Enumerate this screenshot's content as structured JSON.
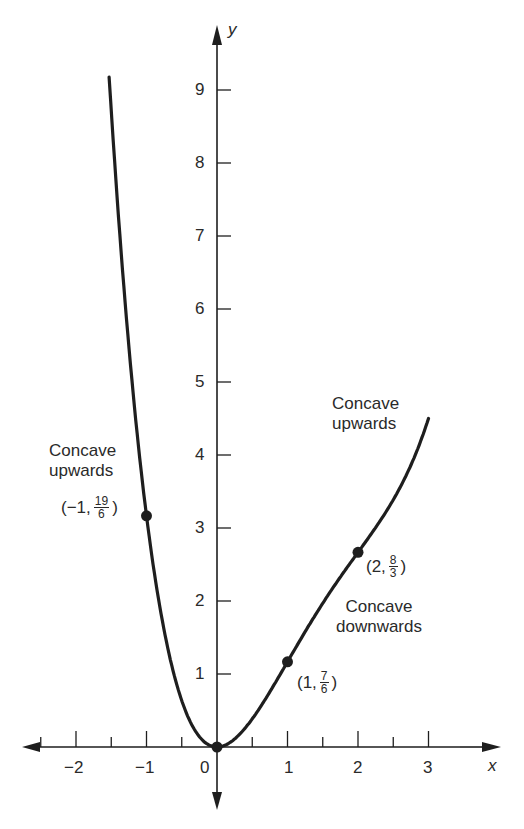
{
  "chart_data": {
    "type": "line",
    "title": "",
    "xlabel": "x",
    "ylabel": "y",
    "function": "y = x^4/6 - x^3 + 2x^2",
    "xlim": [
      -2.5,
      3.5
    ],
    "ylim": [
      -0.3,
      9.7
    ],
    "x_ticks": [
      -2,
      -1,
      0,
      1,
      2,
      3
    ],
    "x_minor_ticks": [
      -2.5,
      -1.5,
      -0.5,
      0.5,
      1.5,
      2.5
    ],
    "y_ticks": [
      1,
      2,
      3,
      4,
      5,
      6,
      7,
      8,
      9
    ],
    "grid": false,
    "series": [
      {
        "name": "curve",
        "x": [
          -1.53,
          -1.4,
          -1.2,
          -1.0,
          -0.8,
          -0.6,
          -0.4,
          -0.2,
          0,
          0.2,
          0.4,
          0.6,
          0.8,
          1.0,
          1.2,
          1.4,
          1.6,
          1.8,
          2.0,
          2.2,
          2.4,
          2.6,
          2.8,
          3.0
        ],
        "y": [
          9.28,
          7.36,
          5.07,
          3.17,
          1.86,
          0.96,
          0.39,
          0.09,
          0,
          0.07,
          0.26,
          0.51,
          0.79,
          1.17,
          1.49,
          1.83,
          2.14,
          2.43,
          2.67,
          2.87,
          3.05,
          3.22,
          3.4,
          4.5
        ]
      }
    ],
    "marked_points": [
      {
        "x": -1,
        "y": 3.1667,
        "label": "(−1, 19/6)"
      },
      {
        "x": 0,
        "y": 0,
        "label": ""
      },
      {
        "x": 1,
        "y": 1.1667,
        "label": "(1, 7/6)"
      },
      {
        "x": 2,
        "y": 2.6667,
        "label": "(2, 8/3)"
      }
    ],
    "annotations": [
      {
        "text": "Concave upwards",
        "near": "left branch"
      },
      {
        "text": "Concave upwards",
        "near": "right end"
      },
      {
        "text": "Concave downwards",
        "near": "between x=1 and x=2"
      }
    ]
  },
  "labels": {
    "x_axis": "x",
    "y_axis": "y",
    "x_ticks": [
      "−2",
      "−1",
      "0",
      "1",
      "2",
      "3"
    ],
    "y_ticks": [
      "1",
      "2",
      "3",
      "4",
      "5",
      "6",
      "7",
      "8",
      "9"
    ],
    "left_annotation_line1": "Concave",
    "left_annotation_line2": "upwards",
    "right_annotation_line1": "Concave",
    "right_annotation_line2": "upwards",
    "mid_annotation_line1": "Concave",
    "mid_annotation_line2": "downwards",
    "pt_neg1": {
      "prefix": "(−1,",
      "num": "19",
      "den": "6",
      "suffix": ")"
    },
    "pt_1": {
      "prefix": "(1,",
      "num": "7",
      "den": "6",
      "suffix": ")"
    },
    "pt_2": {
      "prefix": "(2,",
      "num": "8",
      "den": "3",
      "suffix": ")"
    }
  },
  "style": {
    "ink": "#1e1e1e",
    "background": "#ffffff"
  }
}
